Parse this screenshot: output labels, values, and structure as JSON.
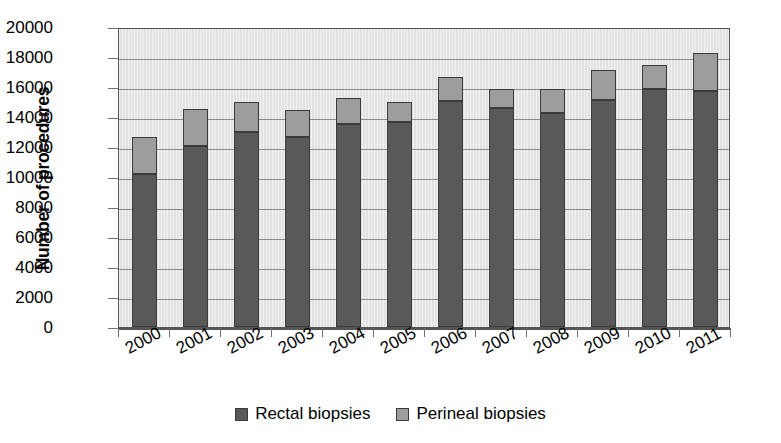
{
  "chart_data": {
    "type": "bar",
    "subtype": "stacked-vertical",
    "title": "",
    "xlabel": "",
    "ylabel": "Number of procedures",
    "ylim": [
      0,
      20000
    ],
    "ytick_step": 2000,
    "yticks": [
      0,
      2000,
      4000,
      6000,
      8000,
      10000,
      12000,
      14000,
      16000,
      18000,
      20000
    ],
    "ytick_labels": [
      "0",
      "2000",
      "4000",
      "6000",
      "8000",
      "10000",
      "12000",
      "14000",
      "16000",
      "18000",
      "20000"
    ],
    "grid": true,
    "grid_axis": "y",
    "legend_position": "bottom",
    "categories": [
      "2000",
      "2001",
      "2002",
      "2003",
      "2004",
      "2005",
      "2006",
      "2007",
      "2008",
      "2009",
      "2010",
      "2011"
    ],
    "series": [
      {
        "name": "Rectal biopsies",
        "color": "#595959",
        "values": [
          10200,
          12100,
          13000,
          12700,
          13550,
          13700,
          15050,
          14600,
          14250,
          15150,
          15900,
          15750
        ]
      },
      {
        "name": "Perineal biopsies",
        "color": "#9d9d9d",
        "values": [
          2450,
          2450,
          2000,
          1750,
          1750,
          1300,
          1650,
          1300,
          1600,
          2000,
          1600,
          2500
        ]
      }
    ],
    "totals": [
      12650,
      14550,
      15000,
      14450,
      15300,
      15000,
      16700,
      15900,
      15850,
      17150,
      17500,
      18250
    ]
  },
  "legend": {
    "items": [
      {
        "label": "Rectal biopsies",
        "color": "#595959"
      },
      {
        "label": "Perineal biopsies",
        "color": "#9d9d9d"
      }
    ]
  },
  "colors": {
    "plot_background": "#e2e2e2",
    "gridline": "#8a8a8a",
    "axis": "#555555",
    "bar_border": "#3a3a3a",
    "text": "#000000"
  }
}
